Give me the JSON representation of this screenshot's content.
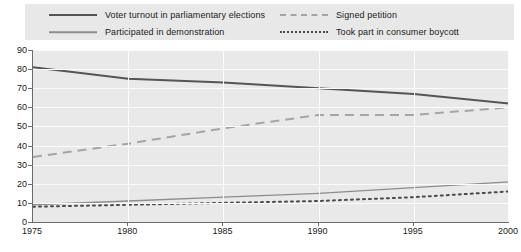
{
  "legend": {
    "items": [
      {
        "label": "Voter turnout in parliamentary elections",
        "style": "solid-thick",
        "color": "#555555"
      },
      {
        "label": "Participated in demonstration",
        "style": "solid-thin",
        "color": "#8d8d8d"
      },
      {
        "label": "Signed petition",
        "style": "dashed",
        "color": "#a5a5a5"
      },
      {
        "label": "Took part in consumer boycott",
        "style": "dotted",
        "color": "#4a4a4a"
      }
    ]
  },
  "axes": {
    "y_ticks": [
      "90",
      "80",
      "70",
      "60",
      "50",
      "40",
      "30",
      "20",
      "10",
      "0"
    ],
    "x_ticks": [
      "1975",
      "1980",
      "1985",
      "1990",
      "1995",
      "2000"
    ]
  },
  "chart_data": {
    "type": "line",
    "title": "",
    "subtitle": "",
    "xlabel": "",
    "ylabel": "",
    "xlim": [
      1975,
      2000
    ],
    "ylim": [
      0,
      90
    ],
    "grid": true,
    "legend_position": "top",
    "x": [
      1975,
      1980,
      1985,
      1990,
      1995,
      2000
    ],
    "categories": [
      "1975",
      "1980",
      "1985",
      "1990",
      "1995",
      "2000"
    ],
    "series": [
      {
        "name": "Voter turnout in parliamentary elections",
        "style": "solid-thick",
        "color": "#555555",
        "values": [
          81,
          75,
          73,
          70,
          67,
          62
        ]
      },
      {
        "name": "Signed petition",
        "style": "dashed",
        "color": "#a5a5a5",
        "values": [
          34,
          41,
          49,
          56,
          56,
          60
        ]
      },
      {
        "name": "Participated in demonstration",
        "style": "solid-thin",
        "color": "#8d8d8d",
        "values": [
          9,
          11,
          13,
          15,
          18,
          21
        ]
      },
      {
        "name": "Took part in consumer boycott",
        "style": "dotted",
        "color": "#4a4a4a",
        "values": [
          8,
          9,
          10,
          11,
          13,
          16
        ]
      }
    ]
  }
}
